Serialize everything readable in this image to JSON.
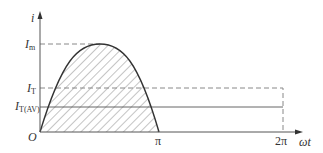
{
  "diagram": {
    "type": "half-wave sinusoidal current waveform",
    "axes": {
      "y_label": "i",
      "x_label": "ωt",
      "origin_label": "O"
    },
    "y_levels": [
      {
        "name": "Im",
        "base": "I",
        "sub": "m",
        "style": "dashed"
      },
      {
        "name": "IT",
        "base": "I",
        "sub": "T",
        "style": "dashed"
      },
      {
        "name": "IT(AV)",
        "base": "I",
        "sub": "T(AV)",
        "style": "solid"
      }
    ],
    "x_ticks": [
      {
        "label": "π"
      },
      {
        "label": "2π"
      }
    ],
    "colors": {
      "line": "#333333",
      "dashed": "#888888",
      "hatch": "#555555"
    }
  }
}
